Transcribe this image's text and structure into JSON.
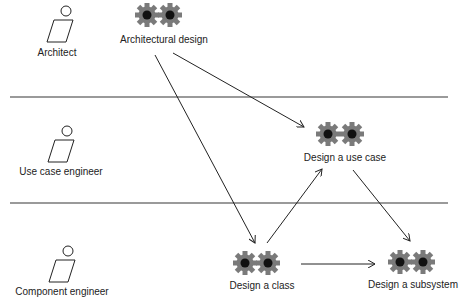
{
  "colors": {
    "gear": "#7a7a7a",
    "gear_hub": "#111111",
    "lane_line": "#9a9a9a",
    "arrow": "#222222",
    "text": "#222222"
  },
  "lanes": [
    {
      "actor": "Architect"
    },
    {
      "actor": "Use case engineer"
    },
    {
      "actor": "Component engineer"
    }
  ],
  "activities": [
    {
      "id": "architectural-design",
      "label": "Architectural design"
    },
    {
      "id": "design-use-case",
      "label": "Design a use case"
    },
    {
      "id": "design-class",
      "label": "Design a class"
    },
    {
      "id": "design-subsystem",
      "label": "Design a subsystem"
    }
  ],
  "flows": [
    {
      "from": "Architectural design",
      "to": "Design a class"
    },
    {
      "from": "Architectural design",
      "to": "Design a use case"
    },
    {
      "from": "Design a class",
      "to": "Design a use case"
    },
    {
      "from": "Design a use case",
      "to": "Design a subsystem"
    },
    {
      "from": "Design a class",
      "to": "Design a subsystem"
    }
  ]
}
